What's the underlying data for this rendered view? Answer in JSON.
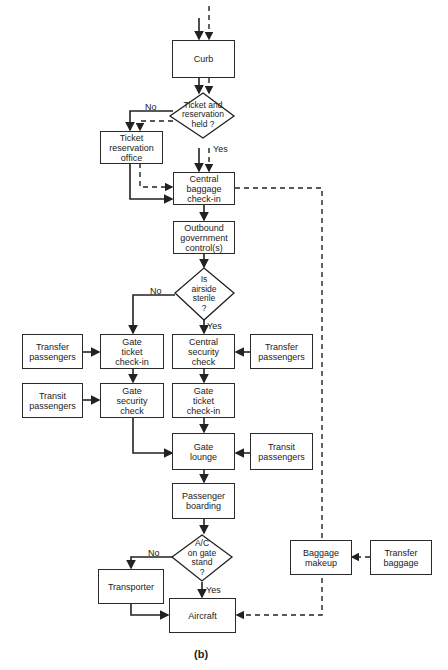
{
  "diagram": {
    "caption": "(b)",
    "nodes": {
      "curb": "Curb",
      "ticket_held": "Ticket and\nreservation\nheld ?",
      "ticket_office": "Ticket\nreservation\noffice",
      "central_baggage": "Central\nbaggage\ncheck-in",
      "outbound_control": "Outbound\ngovernment\ncontrol(s)",
      "airside_sterile": "Is\nairside\nsterile\n?",
      "transfer_pax_left": "Transfer\npassengers",
      "gate_ticket_left": "Gate\nticket\ncheck-in",
      "central_security": "Central\nsecurity\ncheck",
      "transfer_pax_right": "Transfer\npassengers",
      "transit_pax_left": "Transit\npassengers",
      "gate_security": "Gate\nsecurity\ncheck",
      "gate_ticket_right": "Gate\nticket\ncheck-in",
      "gate_lounge": "Gate\nlounge",
      "transit_pax_right": "Transit\npassengers",
      "passenger_boarding": "Passenger\nboarding",
      "ac_on_stand": "A/C\non gate\nstand\n?",
      "transporter": "Transporter",
      "aircraft": "Aircraft",
      "baggage_makeup": "Baggage\nmakeup",
      "transfer_baggage": "Transfer\nbaggage"
    },
    "edge_labels": {
      "ticket_no": "No",
      "ticket_yes": "Yes",
      "sterile_no": "No",
      "sterile_yes": "Yes",
      "stand_no": "No",
      "stand_yes": "Yes"
    },
    "legend": {
      "solid_line": "passenger flow",
      "dashed_line": "baggage flow"
    }
  }
}
